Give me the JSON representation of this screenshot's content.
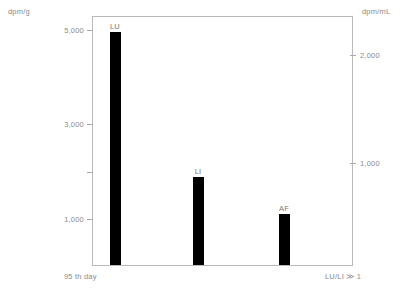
{
  "chart_data": {
    "type": "bar",
    "title": "",
    "categories": [
      "LU",
      "LI",
      "AF"
    ],
    "values": [
      4950,
      1870,
      1080
    ],
    "xlabel": "",
    "ylabel": "dpm/g",
    "y2label": "dpm/mL",
    "ylim": [
      0,
      5320
    ],
    "y2lim": [
      0,
      2270
    ],
    "grid": false,
    "legend": null,
    "left_axis": {
      "unit": "dpm/g",
      "ticks": [
        {
          "value": 5000,
          "label": "5,000"
        },
        {
          "value": 3000,
          "label": "3,000"
        },
        {
          "value": 2000,
          "label": ""
        },
        {
          "value": 1000,
          "label": "1,000"
        }
      ]
    },
    "right_axis": {
      "unit": "dpm/mL",
      "ticks": [
        {
          "value": 2000,
          "label": "2,000"
        },
        {
          "value": 1000,
          "label": "1,000"
        }
      ]
    },
    "annotations": {
      "bottom_left": "95 th day",
      "bottom_right": "LU/LI ≫ 1"
    },
    "colors": {
      "bar": "#000000",
      "axis": "#b9b9b9",
      "text": "#8a8a8a"
    }
  }
}
